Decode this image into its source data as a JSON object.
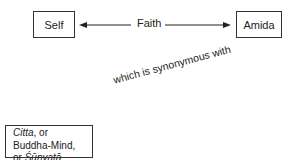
{
  "diagram": {
    "nodes": {
      "self": {
        "label": "Self"
      },
      "amida": {
        "label": "Amida"
      },
      "citta": {
        "line1_italic": "Citta",
        "line1_rest": ", or",
        "line2": "Buddha-Mind,",
        "line3_prefix": "or ",
        "line3_italic": "Śūnyatā"
      }
    },
    "edges": {
      "faith": {
        "label": "Faith",
        "from": "Self",
        "to": "Amida",
        "bidirectional": true
      },
      "synonym": {
        "label": "which is synonymous with"
      }
    }
  }
}
